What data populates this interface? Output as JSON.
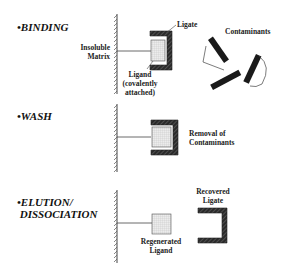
{
  "diagram": {
    "steps": [
      {
        "id": "binding",
        "title": "•BINDING",
        "labels": {
          "matrix": "Insoluble\nMatrix",
          "ligate": "Ligate",
          "ligand": "Ligand\n(covalently\nattached)",
          "contaminants": "Contaminants"
        }
      },
      {
        "id": "wash",
        "title": "•WASH",
        "labels": {
          "removal": "Removal of\nContaminants"
        }
      },
      {
        "id": "elution",
        "title": "•ELUTION/\n DISSOCIATION",
        "labels": {
          "recovered": "Recovered\nLigate",
          "regenerated": "Regenerated\nLigand"
        }
      }
    ],
    "colors": {
      "line": "#333333",
      "ligate_fill": "#2a2a2a",
      "ligand_fill": "#e6e6e6",
      "ligand_grid": "#bcbcbc"
    }
  }
}
